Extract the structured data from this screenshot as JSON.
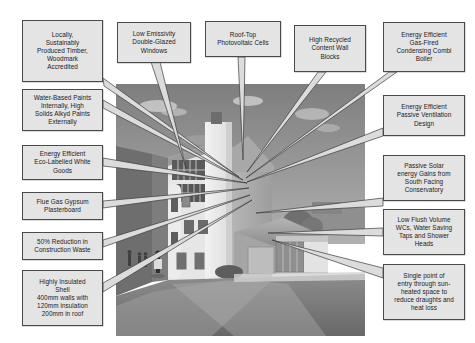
{
  "diagram": {
    "style": {
      "box_fill": "#e4e4e4",
      "box_border": "#4a4a4a",
      "text_color": "#1b1b1b",
      "leader_fill": "#d9d9d9",
      "leader_stroke": "#3a3a3a",
      "photo_tone": "grayscale"
    },
    "photo": {
      "alt_name": "building-photograph",
      "description": "Black and white photograph of a white rendered modern building with stair tower, pitched-roof outbuilding and people walking on the approach path"
    },
    "callouts": [
      {
        "id": "timber",
        "name": "callout-timber",
        "text": "Locally,\nSustainably\nProduced Timber,\nWoodmark\nAccredited"
      },
      {
        "id": "windows",
        "name": "callout-low-emissivity-windows",
        "text": "Low Emissivity\nDouble-Glazed\nWindows"
      },
      {
        "id": "pv",
        "name": "callout-rooftop-photovoltaic",
        "text": "Roof-Top\nPhotovoltaic Cells"
      },
      {
        "id": "blocks",
        "name": "callout-recycled-wall-blocks",
        "text": "High Recycled\nContent Wall\nBlocks"
      },
      {
        "id": "boiler",
        "name": "callout-condensing-combi-boiler",
        "text": "Energy Efficient\nGas-Fired\nCondensing Combi\nBoiler"
      },
      {
        "id": "paints",
        "name": "callout-water-based-paints",
        "text": "Water-Based Paints\nInternally, High\nSolids Alkyd Paints\nExternally"
      },
      {
        "id": "ventilation",
        "name": "callout-passive-ventilation",
        "text": "Energy Efficient\nPassive Ventilation\nDesign"
      },
      {
        "id": "whitegoods",
        "name": "callout-eco-labelled-white-goods",
        "text": "Energy Efficient\nEco-Labelled White\nGoods"
      },
      {
        "id": "solar",
        "name": "callout-passive-solar-gains",
        "text": "Passive Solar\nenergy Gains from\nSouth Facing\nConservatory"
      },
      {
        "id": "plasterboard",
        "name": "callout-flue-gas-gypsum-plasterboard",
        "text": "Flue Gas Gypsum\nPlasterboard"
      },
      {
        "id": "water",
        "name": "callout-low-flush-water-saving",
        "text": "Low Flush Volume\nWCs, Water Saving\nTaps and Shower\nHeads"
      },
      {
        "id": "waste",
        "name": "callout-construction-waste-reduction",
        "text": "50% Reduction in\nConstruction Waste"
      },
      {
        "id": "insulation",
        "name": "callout-highly-insulated-shell",
        "text": "Highly Insulated\nShell\n400mm walls with\n120mm insulation\n200mm in roof"
      },
      {
        "id": "entry",
        "name": "callout-single-entry-point",
        "text": "Single point of\nentry through sun-\nheated space to\nreduce draughts and\nheat loss"
      }
    ]
  }
}
